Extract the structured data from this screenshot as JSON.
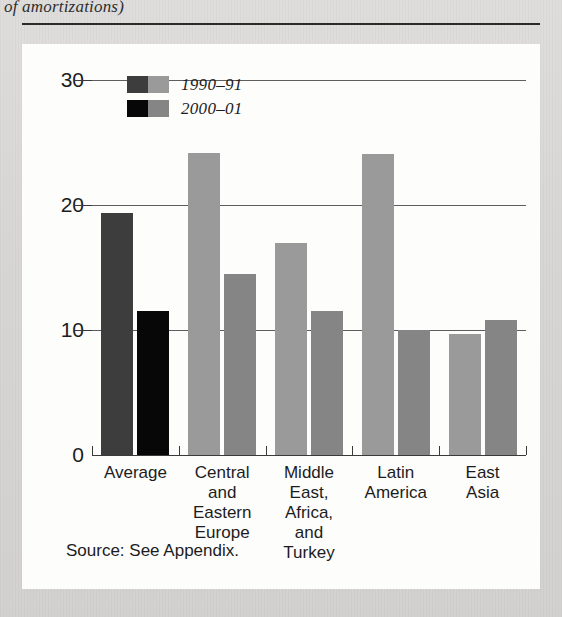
{
  "page": {
    "caption_tail": "of amortizations)",
    "source_note": "Source: See Appendix."
  },
  "legend": {
    "items": [
      {
        "label": "1990–91",
        "color_dark": "#3d3d3d",
        "color_light": "#9a9a9a"
      },
      {
        "label": "2000–01",
        "color_dark": "#070707",
        "color_light": "#858585"
      }
    ]
  },
  "axis": {
    "y_ticks": [
      "0",
      "10",
      "20",
      "30"
    ],
    "y_values": [
      0,
      10,
      20,
      30
    ]
  },
  "chart_data": {
    "type": "bar",
    "title": "",
    "xlabel": "",
    "ylabel": "",
    "ylim": [
      0,
      30
    ],
    "yticks": [
      0,
      10,
      20,
      30
    ],
    "grid": true,
    "legend_position": "top-left-inside",
    "categories": [
      "Average",
      "Central\nand\nEastern\nEurope",
      "Middle\nEast,\nAfrica,\nand\nTurkey",
      "Latin\nAmerica",
      "East\nAsia"
    ],
    "series": [
      {
        "name": "1990–91",
        "values": [
          19.4,
          24.2,
          17.0,
          24.1,
          9.7
        ],
        "colors": [
          "#3d3d3d",
          "#9a9a9a",
          "#9a9a9a",
          "#9a9a9a",
          "#9a9a9a"
        ]
      },
      {
        "name": "2000–01",
        "values": [
          11.5,
          14.5,
          11.5,
          10.0,
          10.8
        ],
        "colors": [
          "#070707",
          "#858585",
          "#858585",
          "#858585",
          "#858585"
        ]
      }
    ]
  }
}
